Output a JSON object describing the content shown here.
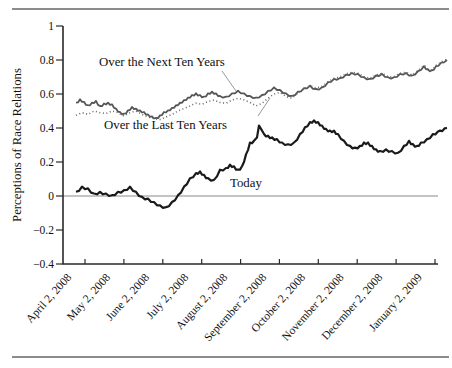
{
  "figure": {
    "width": 452,
    "height": 368
  },
  "colors": {
    "today_line": "#1a1a1a",
    "next_line": "#565656",
    "last_line": "#6a6a6a",
    "axis": "#2a2a2a",
    "zero_line": "#8a8a8a",
    "leader": "#999999",
    "divider_rule": "#8c8c8c",
    "text": "#111111",
    "background": "#ffffff"
  },
  "chart_data": {
    "type": "line",
    "title": "",
    "xlabel": "",
    "ylabel": "Perceptions of Race Relations",
    "ylim": [
      -0.4,
      1
    ],
    "grid": false,
    "zero_reference_line": 0,
    "y_ticks": [
      {
        "label": "1",
        "value": 1.0
      },
      {
        "label": "0.8",
        "value": 0.8
      },
      {
        "label": "0.6",
        "value": 0.6
      },
      {
        "label": "0.4",
        "value": 0.4
      },
      {
        "label": "0.2",
        "value": 0.2
      },
      {
        "label": "0",
        "value": 0.0
      },
      {
        "label": "−0.2",
        "value": -0.2
      },
      {
        "label": "−0.4",
        "value": -0.4
      }
    ],
    "x_ticks": [
      {
        "label": "April 2, 2008",
        "px": 85.0
      },
      {
        "label": "May 2, 2008",
        "px": 123.9
      },
      {
        "label": "June 2, 2008",
        "px": 162.8
      },
      {
        "label": "July 2, 2008",
        "px": 201.7
      },
      {
        "label": "August 2, 2008",
        "px": 240.6
      },
      {
        "label": "September 2, 2008",
        "px": 279.4
      },
      {
        "label": "October 2, 2008",
        "px": 318.3
      },
      {
        "label": "November 2, 2008",
        "px": 357.2
      },
      {
        "label": "December 2, 2008",
        "px": 396.1
      },
      {
        "label": "January 2, 2009",
        "px": 435.0
      }
    ],
    "layout": {
      "x_left": 63,
      "x_right": 438,
      "y_top": 26,
      "y_bottom": 264,
      "y_zero": 196,
      "px_per_unit": 170
    },
    "annotations": [
      {
        "text": "Over the Next Ten Years",
        "x": 99,
        "y": 55,
        "leader": {
          "x1": 222,
          "y1": 71,
          "x2": 236,
          "y2": 91
        }
      },
      {
        "text": "Over the Last Ten Years",
        "x": 104,
        "y": 118,
        "leader": {
          "x1": 258,
          "y1": 116,
          "x2": 270,
          "y2": 98
        }
      },
      {
        "text": "Today",
        "x": 230,
        "y": 176,
        "leader": null
      }
    ],
    "series": [
      {
        "name": "Over the Next Ten Years",
        "style": "solid",
        "color_key": "next_line",
        "width": 1.8,
        "jitter": 0.7,
        "points": [
          [
            76,
            0.545
          ],
          [
            80,
            0.565
          ],
          [
            84,
            0.55
          ],
          [
            88,
            0.53
          ],
          [
            92,
            0.545
          ],
          [
            96,
            0.555
          ],
          [
            100,
            0.525
          ],
          [
            104,
            0.54
          ],
          [
            108,
            0.545
          ],
          [
            112,
            0.535
          ],
          [
            116,
            0.51
          ],
          [
            120,
            0.49
          ],
          [
            124,
            0.48
          ],
          [
            128,
            0.5
          ],
          [
            132,
            0.52
          ],
          [
            136,
            0.51
          ],
          [
            140,
            0.5
          ],
          [
            144,
            0.49
          ],
          [
            148,
            0.475
          ],
          [
            152,
            0.465
          ],
          [
            156,
            0.455
          ],
          [
            160,
            0.47
          ],
          [
            164,
            0.49
          ],
          [
            168,
            0.5
          ],
          [
            172,
            0.515
          ],
          [
            176,
            0.53
          ],
          [
            180,
            0.545
          ],
          [
            184,
            0.56
          ],
          [
            188,
            0.575
          ],
          [
            192,
            0.59
          ],
          [
            196,
            0.6
          ],
          [
            200,
            0.59
          ],
          [
            204,
            0.58
          ],
          [
            208,
            0.6
          ],
          [
            212,
            0.61
          ],
          [
            216,
            0.6
          ],
          [
            220,
            0.585
          ],
          [
            226,
            0.58
          ],
          [
            232,
            0.6
          ],
          [
            238,
            0.615
          ],
          [
            244,
            0.6
          ],
          [
            250,
            0.585
          ],
          [
            256,
            0.575
          ],
          [
            262,
            0.59
          ],
          [
            268,
            0.615
          ],
          [
            274,
            0.635
          ],
          [
            280,
            0.62
          ],
          [
            286,
            0.6
          ],
          [
            292,
            0.585
          ],
          [
            298,
            0.61
          ],
          [
            304,
            0.63
          ],
          [
            310,
            0.645
          ],
          [
            316,
            0.625
          ],
          [
            322,
            0.635
          ],
          [
            328,
            0.665
          ],
          [
            334,
            0.685
          ],
          [
            340,
            0.69
          ],
          [
            346,
            0.71
          ],
          [
            352,
            0.72
          ],
          [
            358,
            0.715
          ],
          [
            364,
            0.695
          ],
          [
            370,
            0.685
          ],
          [
            376,
            0.705
          ],
          [
            382,
            0.715
          ],
          [
            388,
            0.695
          ],
          [
            394,
            0.695
          ],
          [
            400,
            0.715
          ],
          [
            406,
            0.72
          ],
          [
            412,
            0.705
          ],
          [
            418,
            0.73
          ],
          [
            424,
            0.76
          ],
          [
            428,
            0.74
          ],
          [
            432,
            0.735
          ],
          [
            436,
            0.76
          ],
          [
            441,
            0.78
          ],
          [
            447,
            0.8
          ]
        ]
      },
      {
        "name": "Over the Last Ten Years",
        "style": "dotted",
        "color_key": "last_line",
        "width": 1.6,
        "jitter": 0,
        "points": [
          [
            76,
            0.475
          ],
          [
            82,
            0.49
          ],
          [
            88,
            0.48
          ],
          [
            94,
            0.5
          ],
          [
            100,
            0.49
          ],
          [
            106,
            0.485
          ],
          [
            112,
            0.5
          ],
          [
            118,
            0.49
          ],
          [
            124,
            0.47
          ],
          [
            130,
            0.49
          ],
          [
            136,
            0.5
          ],
          [
            142,
            0.48
          ],
          [
            148,
            0.465
          ],
          [
            154,
            0.455
          ],
          [
            160,
            0.45
          ],
          [
            166,
            0.465
          ],
          [
            172,
            0.48
          ],
          [
            178,
            0.5
          ],
          [
            184,
            0.515
          ],
          [
            190,
            0.53
          ],
          [
            196,
            0.545
          ],
          [
            202,
            0.54
          ],
          [
            208,
            0.555
          ],
          [
            214,
            0.565
          ],
          [
            220,
            0.55
          ],
          [
            226,
            0.545
          ],
          [
            232,
            0.565
          ],
          [
            238,
            0.575
          ],
          [
            244,
            0.565
          ],
          [
            250,
            0.55
          ],
          [
            256,
            0.53
          ],
          [
            262,
            0.545
          ],
          [
            268,
            0.575
          ],
          [
            274,
            0.6
          ],
          [
            280,
            0.61
          ],
          [
            286,
            0.585
          ],
          [
            292,
            0.575
          ],
          [
            298,
            0.605
          ],
          [
            304,
            0.63
          ],
          [
            310,
            0.65
          ],
          [
            316,
            0.635
          ],
          [
            322,
            0.645
          ],
          [
            328,
            0.672
          ],
          [
            334,
            0.692
          ],
          [
            340,
            0.7
          ],
          [
            346,
            0.718
          ],
          [
            352,
            0.728
          ],
          [
            358,
            0.722
          ],
          [
            364,
            0.702
          ],
          [
            370,
            0.692
          ],
          [
            376,
            0.712
          ],
          [
            382,
            0.722
          ],
          [
            388,
            0.702
          ],
          [
            394,
            0.702
          ],
          [
            400,
            0.722
          ],
          [
            406,
            0.728
          ],
          [
            412,
            0.712
          ],
          [
            418,
            0.738
          ],
          [
            424,
            0.768
          ],
          [
            428,
            0.748
          ],
          [
            432,
            0.742
          ],
          [
            436,
            0.768
          ],
          [
            441,
            0.788
          ],
          [
            447,
            0.805
          ]
        ]
      },
      {
        "name": "Today",
        "style": "solid",
        "color_key": "today_line",
        "width": 2.2,
        "jitter": 0.8,
        "points": [
          [
            76,
            0.02
          ],
          [
            82,
            0.05
          ],
          [
            88,
            0.04
          ],
          [
            94,
            0.01
          ],
          [
            100,
            0.02
          ],
          [
            106,
            0.01
          ],
          [
            112,
            0.0
          ],
          [
            118,
            0.02
          ],
          [
            124,
            0.03
          ],
          [
            130,
            0.05
          ],
          [
            136,
            0.02
          ],
          [
            142,
            -0.01
          ],
          [
            148,
            -0.02
          ],
          [
            154,
            -0.04
          ],
          [
            160,
            -0.06
          ],
          [
            166,
            -0.07
          ],
          [
            172,
            -0.04
          ],
          [
            178,
            0.0
          ],
          [
            184,
            0.05
          ],
          [
            190,
            0.1
          ],
          [
            196,
            0.13
          ],
          [
            200,
            0.14
          ],
          [
            204,
            0.12
          ],
          [
            208,
            0.1
          ],
          [
            214,
            0.09
          ],
          [
            220,
            0.15
          ],
          [
            226,
            0.16
          ],
          [
            230,
            0.18
          ],
          [
            234,
            0.17
          ],
          [
            238,
            0.15
          ],
          [
            242,
            0.17
          ],
          [
            246,
            0.24
          ],
          [
            250,
            0.31
          ],
          [
            254,
            0.32
          ],
          [
            257,
            0.34
          ],
          [
            259,
            0.41
          ],
          [
            261,
            0.39
          ],
          [
            264,
            0.36
          ],
          [
            268,
            0.35
          ],
          [
            272,
            0.34
          ],
          [
            277,
            0.33
          ],
          [
            282,
            0.31
          ],
          [
            288,
            0.3
          ],
          [
            294,
            0.31
          ],
          [
            300,
            0.36
          ],
          [
            305,
            0.4
          ],
          [
            310,
            0.43
          ],
          [
            314,
            0.44
          ],
          [
            318,
            0.43
          ],
          [
            322,
            0.41
          ],
          [
            326,
            0.39
          ],
          [
            330,
            0.38
          ],
          [
            334,
            0.38
          ],
          [
            338,
            0.36
          ],
          [
            344,
            0.32
          ],
          [
            350,
            0.29
          ],
          [
            355,
            0.28
          ],
          [
            360,
            0.29
          ],
          [
            364,
            0.31
          ],
          [
            368,
            0.31
          ],
          [
            372,
            0.29
          ],
          [
            376,
            0.27
          ],
          [
            380,
            0.26
          ],
          [
            386,
            0.27
          ],
          [
            392,
            0.26
          ],
          [
            398,
            0.25
          ],
          [
            404,
            0.29
          ],
          [
            409,
            0.32
          ],
          [
            413,
            0.3
          ],
          [
            417,
            0.29
          ],
          [
            421,
            0.31
          ],
          [
            427,
            0.33
          ],
          [
            433,
            0.36
          ],
          [
            440,
            0.38
          ],
          [
            447,
            0.4
          ]
        ]
      }
    ]
  }
}
